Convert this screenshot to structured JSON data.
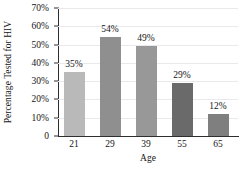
{
  "chart_data": {
    "type": "bar",
    "title": "",
    "xlabel": "Age",
    "ylabel": "Percentage Tested for HIV",
    "categories": [
      "21",
      "29",
      "39",
      "55",
      "65"
    ],
    "values": [
      35,
      54,
      49,
      29,
      12
    ],
    "data_labels": [
      "35%",
      "54%",
      "49%",
      "29%",
      "12%"
    ],
    "bar_colors": [
      "#b9b9b9",
      "#8f8f8f",
      "#989898",
      "#6a6a6a",
      "#7f7f7f"
    ],
    "ylim": [
      0,
      70
    ],
    "yticks": [
      0,
      10,
      20,
      30,
      40,
      50,
      60,
      70
    ],
    "ytick_labels": [
      "0",
      "10%",
      "20%",
      "30%",
      "40%",
      "50%",
      "60%",
      "70%"
    ],
    "grid": true,
    "legend": null,
    "axis_color": "#2e2e2e",
    "grid_color": "#e9e9ec",
    "background": "#ffffff"
  }
}
